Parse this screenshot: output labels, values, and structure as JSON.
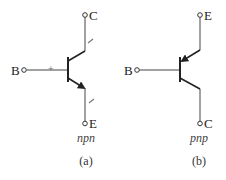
{
  "diagram": {
    "colors": {
      "line": "#333333",
      "label": "#222222",
      "sign": "#666666"
    },
    "npn": {
      "type_label": "npn",
      "caption": "(a)",
      "terminals": {
        "base": "B",
        "collector": "C",
        "emitter": "E"
      },
      "polarity_marks": {
        "base": "+",
        "collector": "−",
        "emitter": "−"
      }
    },
    "pnp": {
      "type_label": "pnp",
      "caption": "(b)",
      "terminals": {
        "base": "B",
        "collector": "C",
        "emitter": "E"
      }
    }
  }
}
